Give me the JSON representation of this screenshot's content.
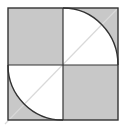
{
  "diagram": {
    "type": "geometric-figure",
    "colors": {
      "shade": "#c8c8c8",
      "stroke": "#333333",
      "diagonal": "#d9d9d9",
      "background": "#ffffff"
    },
    "quadrants": [
      {
        "position": "top-left",
        "fill": "shaded"
      },
      {
        "position": "top-right",
        "fill": "quarter-circle-white-with-shaded-corner"
      },
      {
        "position": "bottom-left",
        "fill": "quarter-circle-white-with-shaded-corner"
      },
      {
        "position": "bottom-right",
        "fill": "shaded"
      }
    ]
  }
}
